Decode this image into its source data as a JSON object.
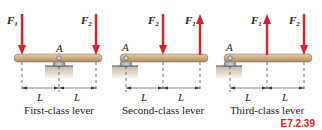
{
  "figure_id": "E7.2.39",
  "colors": {
    "force_arrow": "#d4232b",
    "beam": "#cfae84",
    "support": "#9fb2c4",
    "ground": "#c9b8a6",
    "figure_id": "#d9262c"
  },
  "panels": [
    {
      "caption": "First-class lever",
      "pivot_label": "A",
      "dim_label_left": "L",
      "dim_label_right": "L",
      "forces": [
        {
          "name": "F",
          "sub": "1",
          "direction": "down",
          "position": "left-end"
        },
        {
          "name": "F",
          "sub": "2",
          "direction": "down",
          "position": "right-end"
        }
      ]
    },
    {
      "caption": "Second-class lever",
      "pivot_label": "A",
      "dim_label_left": "L",
      "dim_label_right": "L",
      "forces": [
        {
          "name": "F",
          "sub": "2",
          "direction": "down",
          "position": "middle"
        },
        {
          "name": "F",
          "sub": "1",
          "direction": "up",
          "position": "right-end"
        }
      ]
    },
    {
      "caption": "Third-class lever",
      "pivot_label": "A",
      "dim_label_left": "L",
      "dim_label_right": "L",
      "forces": [
        {
          "name": "F",
          "sub": "1",
          "direction": "up",
          "position": "middle"
        },
        {
          "name": "F",
          "sub": "2",
          "direction": "down",
          "position": "right-end"
        }
      ]
    }
  ]
}
